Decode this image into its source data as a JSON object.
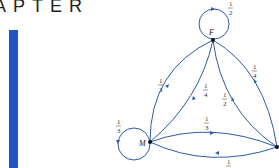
{
  "header": {
    "chapter_label": "APTER"
  },
  "accent": {
    "bar_color": "#1f56c4",
    "edge_color": "#2f5aa8"
  },
  "graph": {
    "nodes": [
      {
        "id": "F",
        "label": "F"
      },
      {
        "id": "M",
        "label": "M"
      },
      {
        "id": "R",
        "label": ""
      }
    ],
    "edges": [
      {
        "from": "F",
        "to": "F",
        "weight": "1/2",
        "num": "1",
        "den": "2"
      },
      {
        "from": "M",
        "to": "M",
        "weight": "1/3",
        "num": "1",
        "den": "3"
      },
      {
        "from": "F",
        "to": "M",
        "route": "outer",
        "weight": "1/3",
        "num": "1",
        "den": "3"
      },
      {
        "from": "F",
        "to": "M",
        "route": "inner",
        "weight": "1/4",
        "num": "1",
        "den": "4"
      },
      {
        "from": "R",
        "to": "F",
        "route": "inner",
        "weight": "1/2",
        "num": "1",
        "den": "2"
      },
      {
        "from": "F",
        "to": "R",
        "route": "outer",
        "weight": "1/4",
        "num": "1",
        "den": "4"
      },
      {
        "from": "M",
        "to": "R",
        "route": "upper",
        "weight": "1/3",
        "num": "1",
        "den": "3"
      },
      {
        "from": "R",
        "to": "M",
        "route": "lower",
        "weight": "1/4",
        "num": "1",
        "den": "4"
      }
    ]
  }
}
